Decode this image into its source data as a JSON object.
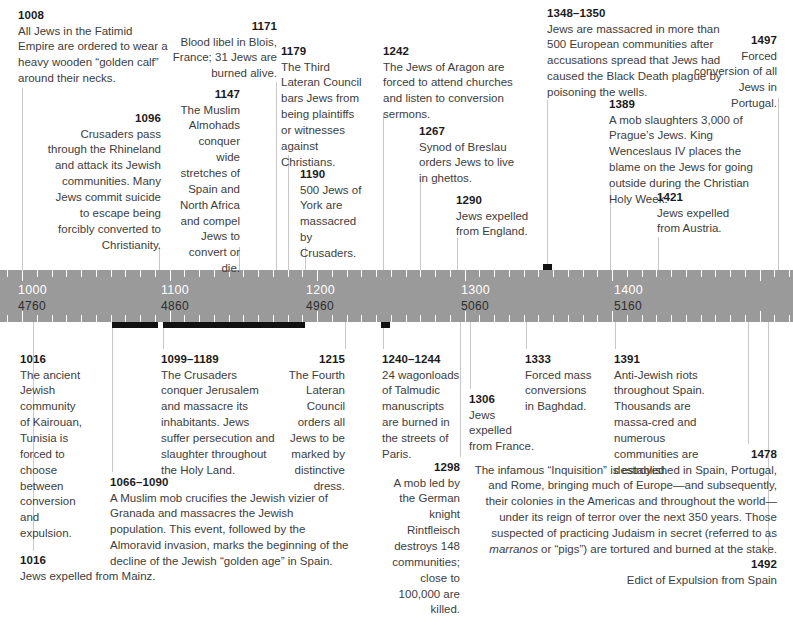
{
  "axis": {
    "ticks_label": "axis-tick",
    "scale_note": "Gregorian year over Hebrew-calendar year",
    "labels": [
      {
        "gregorian": "1000",
        "hebrew": "4760",
        "x": 18
      },
      {
        "gregorian": "1100",
        "hebrew": "4860",
        "x": 161
      },
      {
        "gregorian": "1200",
        "hebrew": "4960",
        "x": 306
      },
      {
        "gregorian": "1300",
        "hebrew": "5060",
        "x": 461
      },
      {
        "gregorian": "1400",
        "hebrew": "5160",
        "x": 614
      }
    ],
    "bar_color": "#9a9a9a",
    "tick_color": "#ffffff",
    "range_color": "#111111",
    "leader_color": "#c8c8c8"
  },
  "ranges": [
    {
      "name": "range-1066-1090",
      "x": 112,
      "width": 46,
      "y": 322
    },
    {
      "name": "range-1099-1189",
      "x": 163,
      "width": 142,
      "y": 322
    },
    {
      "name": "range-1240-1244",
      "x": 381,
      "width": 9,
      "y": 322
    },
    {
      "name": "range-1348-1350",
      "x": 543,
      "width": 9,
      "y": 264
    }
  ],
  "events_above": [
    {
      "id": "ev-1008",
      "year": "1008",
      "text": "All Jews in the Fatimid Empire are ordered to wear a heavy wooden “golden calf” around their necks.",
      "align": "left",
      "left": 18,
      "top": 8,
      "width": 150,
      "leader_x": 22,
      "leader_top": 88,
      "leader_bottom": 270
    },
    {
      "id": "ev-1096",
      "year": "1096",
      "text": "Crusaders pass through the Rhineland and attack its Jewish communities. Many Jews commit suicide to escape being forcibly converted to Christianity.",
      "align": "right",
      "left": 44,
      "top": 111,
      "width": 117,
      "leader_x": 159,
      "leader_top": 247,
      "leader_bottom": 270
    },
    {
      "id": "ev-1147",
      "year": "1147",
      "text": "The Muslim Almohads conquer wide stretches of Spain and North Africa and compel Jews to convert or die.",
      "align": "right",
      "left": 172,
      "top": 87,
      "width": 68,
      "leader_x": 239,
      "leader_top": 247,
      "leader_bottom": 270
    },
    {
      "id": "ev-1171",
      "year": "1171",
      "text": "Blood libel in Blois, France; 31 Jews are burned alive.",
      "align": "right",
      "left": 160,
      "top": 19,
      "width": 117,
      "leader_x": 276,
      "leader_top": 82,
      "leader_bottom": 270
    },
    {
      "id": "ev-1179",
      "year": "1179",
      "text": "The Third Lateran Council bars Jews from being plaintiffs or witnesses against Christians.",
      "align": "left",
      "left": 281,
      "top": 44,
      "width": 85,
      "leader_x": 288,
      "leader_top": 155,
      "leader_bottom": 270
    },
    {
      "id": "ev-1190",
      "year": "1190",
      "text": "500 Jews of York are massacred by Crusaders.",
      "align": "left",
      "left": 300,
      "top": 167,
      "width": 70,
      "leader_x": 305,
      "leader_top": 247,
      "leader_bottom": 270
    },
    {
      "id": "ev-1242",
      "year": "1242",
      "text": "The Jews of Aragon are forced to attend churches and listen to conversion sermons.",
      "align": "left",
      "left": 383,
      "top": 44,
      "width": 135,
      "leader_x": 383,
      "leader_top": 114,
      "leader_bottom": 270
    },
    {
      "id": "ev-1267",
      "year": "1267",
      "text": "Synod of Breslau orders Jews to live in ghettos.",
      "align": "left",
      "left": 419,
      "top": 124,
      "width": 100,
      "leader_x": 420,
      "leader_top": 180,
      "leader_bottom": 270
    },
    {
      "id": "ev-1290",
      "year": "1290",
      "text": "Jews expelled from England.",
      "align": "left",
      "left": 456,
      "top": 193,
      "width": 78,
      "leader_x": 457,
      "leader_top": 238,
      "leader_bottom": 270
    },
    {
      "id": "ev-1348-1350",
      "year": "1348–1350",
      "text": "Jews are massacred in more than 500 European communities after accusations spread that Jews had caused the Black Death plague by poisoning the wells.",
      "align": "left",
      "left": 547,
      "top": 6,
      "width": 176,
      "leader_x": 547,
      "leader_top": 100,
      "leader_bottom": 264
    },
    {
      "id": "ev-1389",
      "year": "1389",
      "text": "A mob slaughters 3,000 of Prague’s Jews. King Wenceslaus IV places the blame on the Jews for going outside during the Christian Holy Week.",
      "align": "left",
      "left": 609,
      "top": 97,
      "width": 163,
      "leader_x": 610,
      "leader_top": 182,
      "leader_bottom": 270
    },
    {
      "id": "ev-1421",
      "year": "1421",
      "text": "Jews expelled from Austria.",
      "align": "left",
      "left": 657,
      "top": 190,
      "width": 80,
      "leader_x": 658,
      "leader_top": 237,
      "leader_bottom": 270
    },
    {
      "id": "ev-1497",
      "year": "1497",
      "text": "Forced conversion of all Jews in Portugal.",
      "align": "right",
      "left": 691,
      "top": 33,
      "width": 86,
      "leader_x": 778,
      "leader_top": 98,
      "leader_bottom": 270
    }
  ],
  "events_below": [
    {
      "id": "ev-1016-kairouan",
      "year": "1016",
      "text": "The ancient Jewish community of Kairouan, Tunisia is forced to choose between conversion and expulsion.",
      "align": "left",
      "left": 20,
      "top": 352,
      "width": 62,
      "leader_x": 33,
      "leader_top": 322,
      "leader_bottom": 349
    },
    {
      "id": "ev-1016-mainz",
      "year": "1016",
      "text": "Jews expelled from Mainz.",
      "align": "left",
      "left": 20,
      "top": 553,
      "width": 200,
      "leader_x": 33,
      "leader_top": 322,
      "leader_bottom": 551
    },
    {
      "id": "ev-1066-1090",
      "year": "1066–1090",
      "text": "A Muslim mob crucifies the Jewish vizier of Granada and massacres the Jewish population. This event, followed by the Almoravid invasion, marks the beginning of the decline of the Jewish “golden age” in Spain.",
      "align": "left",
      "left": 110,
      "top": 475,
      "width": 240,
      "leader_x": 112,
      "leader_top": 328,
      "leader_bottom": 472
    },
    {
      "id": "ev-1099-1189",
      "year": "1099–1189",
      "text": "The Crusaders conquer Jerusalem and massacre its inhabitants. Jews suffer persecution and slaughter throughout the Holy Land.",
      "align": "left",
      "left": 161,
      "top": 352,
      "width": 119,
      "leader_x": 163,
      "leader_top": 328,
      "leader_bottom": 349
    },
    {
      "id": "ev-1215",
      "year": "1215",
      "text": "The Fourth Lateran Council orders all Jews to be marked by distinctive dress.",
      "align": "right",
      "left": 288,
      "top": 352,
      "width": 57,
      "leader_x": 345,
      "leader_top": 322,
      "leader_bottom": 349
    },
    {
      "id": "ev-1240-1244",
      "year": "1240–1244",
      "text": "24 wagonloads of Talmudic manuscripts are burned in the streets of Paris.",
      "align": "left",
      "left": 382,
      "top": 352,
      "width": 78,
      "leader_x": 383,
      "leader_top": 328,
      "leader_bottom": 349
    },
    {
      "id": "ev-1298",
      "year": "1298",
      "text": "A mob led by the German knight Rintfleisch destroys 148 communities; close to 100,000 are killed.",
      "align": "right",
      "left": 376,
      "top": 460,
      "width": 84,
      "leader_x": 460,
      "leader_top": 322,
      "leader_bottom": 457
    },
    {
      "id": "ev-1306",
      "year": "1306",
      "text": "Jews expelled from France.",
      "align": "left",
      "left": 469,
      "top": 392,
      "width": 68,
      "leader_x": 470,
      "leader_top": 322,
      "leader_bottom": 389
    },
    {
      "id": "ev-1333",
      "year": "1333",
      "text": "Forced mass conversions in Baghdad.",
      "align": "left",
      "left": 525,
      "top": 352,
      "width": 70,
      "leader_x": 526,
      "leader_top": 322,
      "leader_bottom": 349
    },
    {
      "id": "ev-1391",
      "year": "1391",
      "text": "Anti-Jewish riots throughout Spain. Thousands are massa-cred and numerous communities are destroyed.",
      "align": "left",
      "left": 614,
      "top": 352,
      "width": 100,
      "leader_x": 615,
      "leader_top": 322,
      "leader_bottom": 349
    },
    {
      "id": "ev-1478",
      "year": "1478",
      "text": "The infamous “Inquisition” is established in Spain, Portugal, and Rome, bringing much of Europe—and subsequently, their colonies in the Americas and throughout the world—under its reign of terror over the next 350 years. Those suspected of practicing Judaism in secret (referred to as marranos or “pigs”) are tortured and burned at the stake.",
      "align": "right",
      "left": 470,
      "top": 447,
      "width": 307,
      "leader_x": 748,
      "leader_top": 322,
      "leader_bottom": 444
    },
    {
      "id": "ev-1492",
      "year": "1492",
      "text": "Edict of Expulsion from Spain",
      "align": "right",
      "left": 560,
      "top": 557,
      "width": 217,
      "leader_x": 768,
      "leader_top": 322,
      "leader_bottom": 555
    }
  ]
}
